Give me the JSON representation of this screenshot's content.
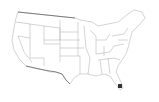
{
  "map": {
    "region": "Contiguous United States",
    "style": "state outlines",
    "line_color": "#9a9a9a",
    "border_color": "#555555",
    "background": "#ffffff",
    "marker": {
      "label": "",
      "color": "#333333",
      "x": 120,
      "y": 86
    }
  }
}
